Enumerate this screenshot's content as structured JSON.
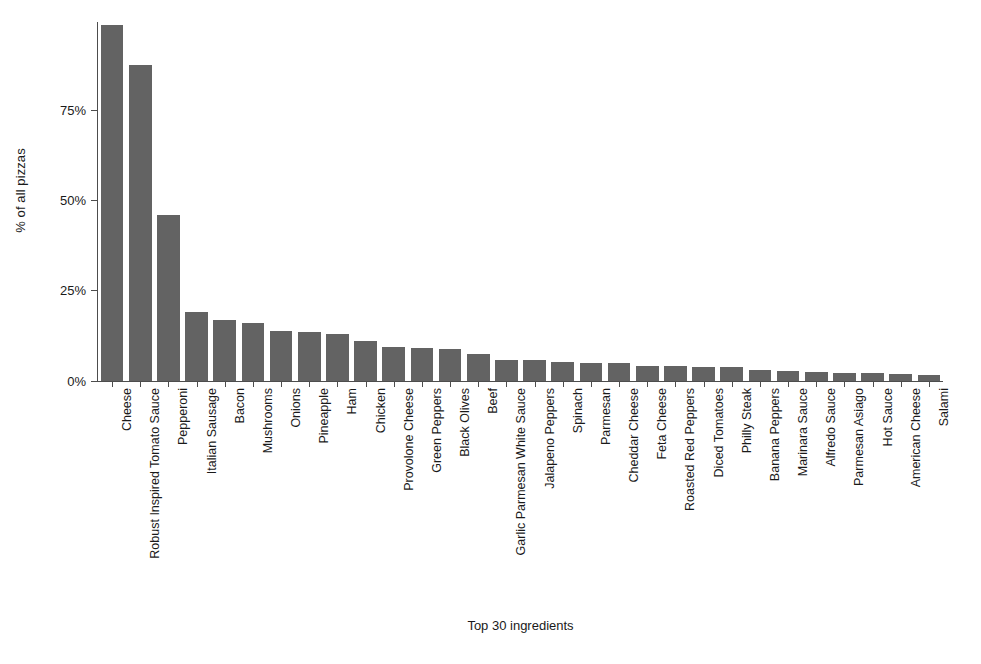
{
  "chart_data": {
    "type": "bar",
    "title": "",
    "subtitle": "",
    "xlabel": "Top 30 ingredients",
    "ylabel": "% of all pizzas",
    "ylim": [
      0,
      100
    ],
    "ytick_values": [
      0,
      25,
      50,
      75
    ],
    "ytick_labels": [
      "0%",
      "25%",
      "50%",
      "75%"
    ],
    "grid": false,
    "legend": false,
    "legend_position": "none",
    "bar_color": "#636363",
    "axis_color": "#4d4d4d",
    "background_color": "#ffffff",
    "orientation": "vertical",
    "categories": [
      "Cheese",
      "Robust Inspired Tomato Sauce",
      "Pepperoni",
      "Italian Sausage",
      "Bacon",
      "Mushrooms",
      "Onions",
      "Pineapple",
      "Ham",
      "Chicken",
      "Provolone Cheese",
      "Green Peppers",
      "Black Olives",
      "Beef",
      "Garlic Parmesan White Sauce",
      "Jalapeno Peppers",
      "Spinach",
      "Parmesan",
      "Cheddar Cheese",
      "Feta Cheese",
      "Roasted Red Peppers",
      "Diced Tomatoes",
      "Philly Steak",
      "Banana Peppers",
      "Marinara Sauce",
      "Alfredo Sauce",
      "Parmesan Asiago",
      "Hot Sauce",
      "American Cheese",
      "Salami"
    ],
    "values": [
      98.5,
      87.5,
      46.0,
      19.0,
      17.0,
      16.2,
      13.8,
      13.5,
      13.0,
      11.2,
      9.3,
      9.2,
      8.9,
      7.6,
      5.8,
      5.7,
      5.2,
      5.1,
      5.0,
      4.2,
      4.1,
      4.0,
      3.8,
      3.1,
      2.8,
      2.5,
      2.3,
      2.1,
      1.9,
      1.6
    ]
  }
}
